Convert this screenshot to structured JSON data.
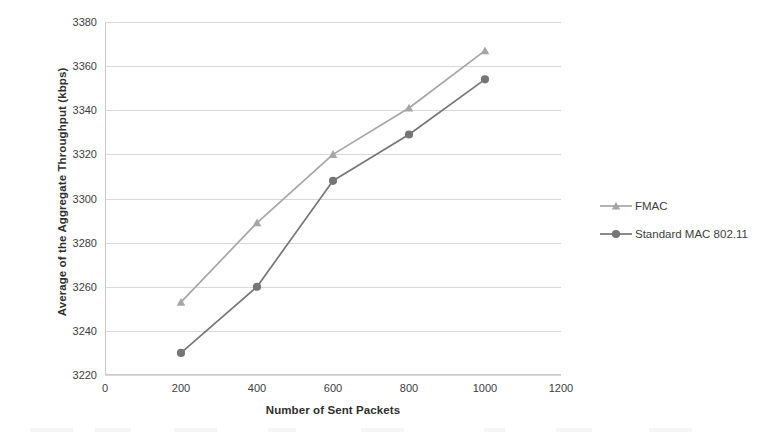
{
  "chart_data": {
    "type": "line",
    "title": "",
    "xlabel": "Number of Sent Packets",
    "ylabel": "Average of the Aggregate Throughput (kbps)",
    "x": [
      200,
      400,
      600,
      800,
      1000
    ],
    "xlim": [
      0,
      1200
    ],
    "ylim": [
      3220,
      3380
    ],
    "x_ticks": [
      "0",
      "200",
      "400",
      "600",
      "800",
      "1000",
      "1200"
    ],
    "x_tick_values": [
      0,
      200,
      400,
      600,
      800,
      1000,
      1200
    ],
    "y_ticks": [
      "3220",
      "3240",
      "3260",
      "3280",
      "3300",
      "3320",
      "3340",
      "3360",
      "3380"
    ],
    "y_tick_values": [
      3220,
      3240,
      3260,
      3280,
      3300,
      3320,
      3340,
      3360,
      3380
    ],
    "grid": "horizontal",
    "legend_position": "right",
    "series": [
      {
        "name": "FMAC",
        "values": [
          3253,
          3289,
          3320,
          3341,
          3367
        ],
        "color": "#a6a6a6",
        "marker": "triangle"
      },
      {
        "name": "Standard MAC 802.11",
        "values": [
          3230,
          3260,
          3308,
          3329,
          3354
        ],
        "color": "#767676",
        "marker": "circle"
      }
    ]
  },
  "legend": {
    "items": [
      {
        "label": "FMAC",
        "color": "#a6a6a6",
        "marker": "triangle"
      },
      {
        "label": "Standard MAC 802.11",
        "color": "#767676",
        "marker": "circle"
      }
    ]
  },
  "axes": {
    "x_title": "Number of Sent Packets",
    "y_title": "Average of the Aggregate Throughput (kbps)"
  }
}
